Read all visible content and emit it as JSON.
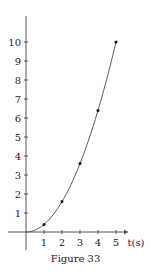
{
  "caption": "Figure 33",
  "chart_data": {
    "type": "line",
    "title": "",
    "caption": "Figure 33",
    "xlabel": "t(s)",
    "ylabel": "",
    "x": [
      1,
      2,
      3,
      4,
      5
    ],
    "series": [
      {
        "name": "curve",
        "values": [
          0.4,
          1.6,
          3.6,
          6.4,
          10
        ]
      }
    ],
    "curve_formula": "y = 0.4 t^2",
    "x_ticks": [
      1,
      2,
      3,
      4,
      5
    ],
    "y_ticks": [
      1,
      2,
      3,
      4,
      5,
      6,
      7,
      8,
      9,
      10
    ],
    "xlim": [
      0,
      5.6
    ],
    "ylim": [
      0,
      11.5
    ],
    "grid": false,
    "legend": null,
    "markers": true
  },
  "layout": {
    "origin_x": 26,
    "origin_y": 232,
    "px_per_x": 18,
    "px_per_y": 19,
    "line_color": "#444444",
    "axis_color": "#555555"
  }
}
